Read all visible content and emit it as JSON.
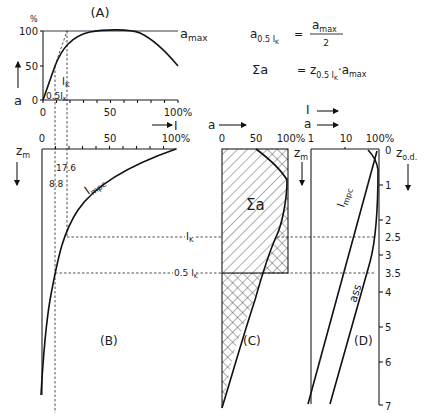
{
  "panels": {
    "A": {
      "label": "(A)",
      "y_unit": "%",
      "y_ticks": [
        "0",
        "50",
        "100"
      ],
      "x_ticks": [
        "0",
        "50",
        "100%"
      ],
      "y_axis_symbol": "a",
      "curve_label": "a",
      "curve_label_sub": "max",
      "ik_label": "I",
      "ik_sub": "K",
      "half_ik_label": "0.5I",
      "half_ik_sub": "K"
    },
    "B": {
      "label": "(B)",
      "x_axis_symbol": "I",
      "x_ticks": [
        "0",
        "50",
        "100%"
      ],
      "z_label": "z",
      "z_sub": "m",
      "curve_label": "I",
      "curve_label_sub": "mpc",
      "marker_17_6": "17.6",
      "marker_8_8": "8.8",
      "ik_label": "I",
      "ik_sub": "K",
      "half_ik_label": "0.5 I",
      "half_ik_sub": "K"
    },
    "C": {
      "label": "(C)",
      "x_axis_symbol": "a",
      "x_ticks": [
        "0",
        "50",
        "100%"
      ],
      "z_label": "z",
      "z_sub": "m",
      "area_label": "Σa"
    },
    "D": {
      "label": "(D)",
      "x_axis_symbol_top": "I",
      "x_axis_symbol_bottom": "a",
      "x_ticks": [
        "1",
        "10",
        "100%"
      ],
      "z_label": "z",
      "z_sub": "m",
      "zod_label": "z",
      "zod_sub": "o.d.",
      "depth_ticks": [
        "0",
        "1",
        "2",
        "2.5",
        "3",
        "3.5",
        "4",
        "5",
        "6",
        "7"
      ],
      "curve1_label": "I",
      "curve1_sub": "mpc",
      "curve2_label": "ass"
    }
  },
  "equations": {
    "eq1_lhs": "a",
    "eq1_lhs_sub": "0.5 I",
    "eq1_lhs_subsub": "K",
    "eq1_eq": "=",
    "eq1_num": "a",
    "eq1_num_sub": "max",
    "eq1_den": "2",
    "eq2_lhs": "Σa",
    "eq2_eq": "=",
    "eq2_z": "z",
    "eq2_z_sub": "0.5 I",
    "eq2_z_subsub": "K",
    "eq2_dot": "·",
    "eq2_a": "a",
    "eq2_a_sub": "max"
  },
  "caption": "Fig. 5   Relationship between light intensity, assimilation and depth"
}
